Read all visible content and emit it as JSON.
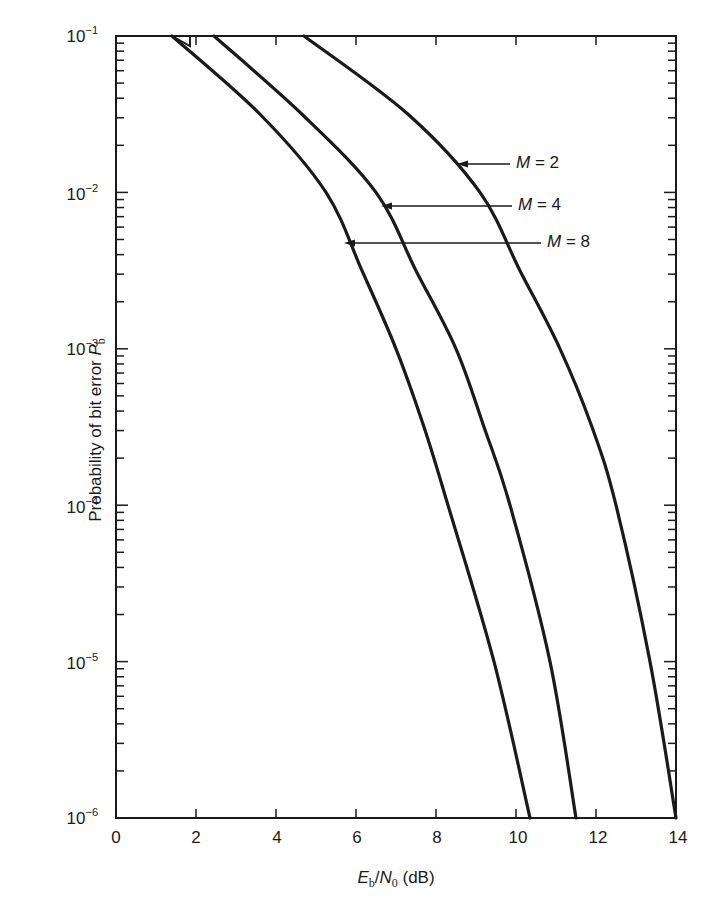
{
  "chart_data": {
    "type": "line",
    "title": "",
    "xlabel": "Eb/N0 (dB)",
    "ylabel": "Probability of bit error Pb",
    "xlim": [
      0,
      14
    ],
    "ylim": [
      1e-06,
      0.1
    ],
    "yscale": "log",
    "grid": false,
    "legend_position": "inline annotations with arrows",
    "x_ticks": [
      0,
      2,
      4,
      6,
      8,
      10,
      12,
      14
    ],
    "y_ticks": [
      "10^-1",
      "10^-2",
      "10^-3",
      "10^-4",
      "10^-5",
      "10^-6"
    ],
    "series": [
      {
        "name": "M = 2",
        "points": [
          [
            4.7,
            0.1
          ],
          [
            7.3,
            0.0316
          ],
          [
            9.1,
            0.01
          ],
          [
            10.1,
            0.00316
          ],
          [
            11.1,
            0.001
          ],
          [
            11.9,
            0.000316
          ],
          [
            12.5,
            0.0001
          ],
          [
            13.35,
            1e-05
          ],
          [
            14.0,
            1e-06
          ]
        ]
      },
      {
        "name": "M = 4",
        "points": [
          [
            2.45,
            0.1
          ],
          [
            4.65,
            0.0316
          ],
          [
            6.5,
            0.01
          ],
          [
            7.5,
            0.00316
          ],
          [
            8.5,
            0.001
          ],
          [
            9.2,
            0.000316
          ],
          [
            9.85,
            0.0001
          ],
          [
            10.85,
            1e-05
          ],
          [
            11.5,
            1e-06
          ]
        ]
      },
      {
        "name": "M = 8",
        "points": [
          [
            1.4,
            0.1
          ],
          [
            3.6,
            0.0316
          ],
          [
            5.25,
            0.01
          ],
          [
            6.15,
            0.00316
          ],
          [
            7.0,
            0.001
          ],
          [
            7.7,
            0.000316
          ],
          [
            8.3,
            0.0001
          ],
          [
            9.45,
            1e-05
          ],
          [
            10.35,
            1e-06
          ]
        ]
      }
    ],
    "annotations": [
      {
        "text": "M = 2",
        "arrow_to_x": 8.5,
        "arrow_to_y": 0.035
      },
      {
        "text": "M = 4",
        "arrow_to_x": 6.6,
        "arrow_to_y": 0.0185
      },
      {
        "text": "M = 8",
        "arrow_to_x": 5.7,
        "arrow_to_y": 0.0108
      }
    ]
  },
  "axes": {
    "x_title_main": "E",
    "x_title_sub1": "b",
    "x_title_slash": "/",
    "x_title_n": "N",
    "x_title_sub2": "0",
    "x_title_unit": " (dB)",
    "y_title_main": "Probability of bit error ",
    "y_title_p": "P",
    "y_title_sub": "b",
    "y_labels": [
      {
        "base": "10",
        "exp": "−1"
      },
      {
        "base": "10",
        "exp": "−2"
      },
      {
        "base": "10",
        "exp": "−3"
      },
      {
        "base": "10",
        "exp": "−4"
      },
      {
        "base": "10",
        "exp": "−5"
      },
      {
        "base": "10",
        "exp": "−6"
      }
    ],
    "x_labels": [
      "0",
      "2",
      "4",
      "6",
      "8",
      "10",
      "12",
      "14"
    ]
  },
  "labels": {
    "m2_italic": "M",
    "m2_rest": " = 2",
    "m4_italic": "M",
    "m4_rest": " = 4",
    "m8_italic": "M",
    "m8_rest": " = 8"
  },
  "style": {
    "line_color": "#1a1a1a",
    "axis_color": "#1a1a1a",
    "background": "#ffffff"
  }
}
